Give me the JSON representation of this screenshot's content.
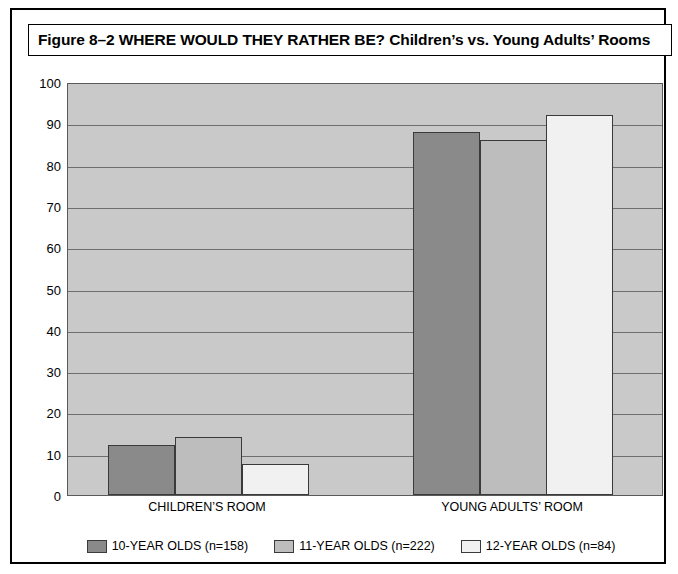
{
  "figure": {
    "title": "Figure 8–2  WHERE WOULD THEY RATHER BE? Children’s vs. Young Adults’ Rooms"
  },
  "chart_data": {
    "type": "bar",
    "title": "Figure 8–2  WHERE WOULD THEY RATHER BE? Children’s vs. Young Adults’ Rooms",
    "xlabel": "",
    "ylabel": "",
    "ylim": [
      0,
      100
    ],
    "yticks": [
      0,
      10,
      20,
      30,
      40,
      50,
      60,
      70,
      80,
      90,
      100
    ],
    "ytick_labels": [
      "0",
      "10",
      "20",
      "30",
      "40",
      "50",
      "60",
      "70",
      "80",
      "90",
      "100"
    ],
    "grid": true,
    "legend_position": "bottom",
    "categories": [
      "CHILDREN’S ROOM",
      "YOUNG ADULTS’ ROOM"
    ],
    "series": [
      {
        "name": "10-YEAR OLDS (n=158)",
        "color": "#8a8a8a",
        "values": [
          12,
          88
        ]
      },
      {
        "name": "11-YEAR OLDS (n=222)",
        "color": "#bdbdbd",
        "values": [
          14,
          86
        ]
      },
      {
        "name": "12-YEAR OLDS (n=84)",
        "color": "#f1f1f1",
        "values": [
          7.5,
          92
        ]
      }
    ]
  },
  "axis": {
    "ticks": [
      {
        "value": 100,
        "label": "100"
      },
      {
        "value": 90,
        "label": "90"
      },
      {
        "value": 80,
        "label": "80"
      },
      {
        "value": 70,
        "label": "70"
      },
      {
        "value": 60,
        "label": "60"
      },
      {
        "value": 50,
        "label": "50"
      },
      {
        "value": 40,
        "label": "40"
      },
      {
        "value": 30,
        "label": "30"
      },
      {
        "value": 20,
        "label": "20"
      },
      {
        "value": 10,
        "label": "10"
      },
      {
        "value": 0,
        "label": "0"
      }
    ]
  },
  "category_labels": [
    {
      "label": "CHILDREN’S ROOM",
      "center_x": 195
    },
    {
      "label": "YOUNG ADULTS’ ROOM",
      "center_x": 500
    }
  ],
  "bars": [
    {
      "name": "bar-childrens-room-10-year-olds",
      "group": "CHILDREN’S ROOM",
      "series": "10-YEAR OLDS (n=158)",
      "value": 12,
      "x": 40,
      "width": 67,
      "color": "#8a8a8a"
    },
    {
      "name": "bar-childrens-room-11-year-olds",
      "group": "CHILDREN’S ROOM",
      "series": "11-YEAR OLDS (n=222)",
      "value": 14,
      "x": 107,
      "width": 67,
      "color": "#bdbdbd"
    },
    {
      "name": "bar-childrens-room-12-year-olds",
      "group": "CHILDREN’S ROOM",
      "series": "12-YEAR OLDS (n=84)",
      "value": 7.5,
      "x": 174,
      "width": 67,
      "color": "#f1f1f1"
    },
    {
      "name": "bar-young-adults-room-10-year-olds",
      "group": "YOUNG ADULTS’ ROOM",
      "series": "10-YEAR OLDS (n=158)",
      "value": 88,
      "x": 345,
      "width": 67,
      "color": "#8a8a8a"
    },
    {
      "name": "bar-young-adults-room-11-year-olds",
      "group": "YOUNG ADULTS’ ROOM",
      "series": "11-YEAR OLDS (n=222)",
      "value": 86,
      "x": 412,
      "width": 67,
      "color": "#bdbdbd"
    },
    {
      "name": "bar-young-adults-room-12-year-olds",
      "group": "YOUNG ADULTS’ ROOM",
      "series": "12-YEAR OLDS (n=84)",
      "value": 92,
      "x": 478,
      "width": 67,
      "color": "#f1f1f1"
    }
  ],
  "legend": {
    "items": [
      {
        "label": "10-YEAR OLDS (n=158)",
        "color": "#8a8a8a"
      },
      {
        "label": "11-YEAR OLDS (n=222)",
        "color": "#bdbdbd"
      },
      {
        "label": "12-YEAR OLDS (n=84)",
        "color": "#f1f1f1"
      }
    ]
  },
  "colors": {
    "plot_background": "#c9c9c9",
    "gridline": "#6e6e6e",
    "bar_outline": "#3a3a3a",
    "page_background": "#ffffff",
    "text": "#000000"
  }
}
